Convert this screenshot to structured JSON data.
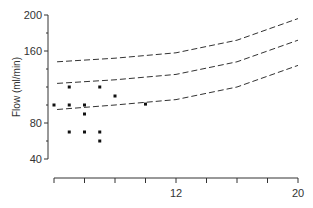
{
  "chart_data": {
    "type": "scatter",
    "title": "",
    "xlabel": "",
    "ylabel": "Flow (ml/min)",
    "xlim": [
      4,
      20
    ],
    "ylim": [
      40,
      200
    ],
    "yticks": [
      40,
      80,
      160,
      200
    ],
    "xtick_labels": [
      {
        "v": 12,
        "l": "12"
      },
      {
        "v": 20,
        "l": "20"
      }
    ],
    "points": [
      [
        4,
        100
      ],
      [
        5,
        120
      ],
      [
        5,
        100
      ],
      [
        5,
        70
      ],
      [
        6,
        100
      ],
      [
        6,
        90
      ],
      [
        6,
        70
      ],
      [
        7,
        120
      ],
      [
        7,
        70
      ],
      [
        7,
        60
      ],
      [
        8,
        110
      ],
      [
        10,
        101
      ]
    ],
    "curves": [
      {
        "name": "upper",
        "points": [
          [
            4.2,
            148
          ],
          [
            8,
            152
          ],
          [
            12,
            158
          ],
          [
            16,
            172
          ],
          [
            20,
            196
          ]
        ]
      },
      {
        "name": "mean",
        "points": [
          [
            4.2,
            124
          ],
          [
            8,
            128
          ],
          [
            12,
            134
          ],
          [
            16,
            148
          ],
          [
            20,
            172
          ]
        ]
      },
      {
        "name": "lower",
        "points": [
          [
            4.2,
            95
          ],
          [
            8,
            100
          ],
          [
            12,
            106
          ],
          [
            16,
            120
          ],
          [
            20,
            144
          ]
        ]
      }
    ],
    "grid": false
  }
}
